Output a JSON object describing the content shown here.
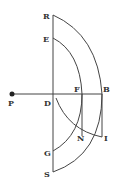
{
  "diagram": {
    "type": "geometric construction",
    "labels": {
      "R": "R",
      "E": "E",
      "P": "P",
      "D": "D",
      "F": "F",
      "B": "B",
      "N": "N",
      "I": "I",
      "G": "G",
      "S": "S"
    },
    "points": {
      "R": [
        53,
        15
      ],
      "E": [
        53,
        38
      ],
      "P": [
        12,
        94
      ],
      "D": [
        53,
        94
      ],
      "F": [
        82,
        94
      ],
      "B": [
        102,
        94
      ],
      "N": [
        82,
        136
      ],
      "I": [
        102,
        137
      ],
      "G": [
        53,
        151
      ],
      "S": [
        53,
        172
      ]
    },
    "colors": {
      "stroke": "#444444",
      "text": "#333333",
      "background": "#ffffff"
    }
  }
}
